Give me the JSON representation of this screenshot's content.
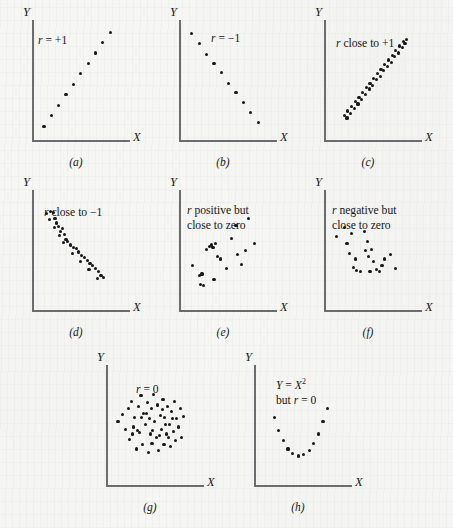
{
  "figure": {
    "axis_label_x": "X",
    "axis_label_y": "Y",
    "dot_color": "#17171c",
    "axis_color": "#6c6c70",
    "background_color": "#f6f6f4"
  },
  "panels": [
    {
      "id": "a",
      "caption": "(a)",
      "note_lines": [
        "r = +1"
      ],
      "note_html": "<i>r</i> = +1",
      "description": "perfect positive linear relationship"
    },
    {
      "id": "b",
      "caption": "(b)",
      "note_lines": [
        "r = −1"
      ],
      "note_html": "<i>r</i> = −1",
      "description": "perfect negative linear relationship"
    },
    {
      "id": "c",
      "caption": "(c)",
      "note_lines": [
        "r close to +1"
      ],
      "note_html": "<i>r</i> close to +1",
      "description": "strong positive linear relationship"
    },
    {
      "id": "d",
      "caption": "(d)",
      "note_lines": [
        "r close to −1"
      ],
      "note_html": "<i>r</i> close to −1",
      "description": "strong negative linear relationship"
    },
    {
      "id": "e",
      "caption": "(e)",
      "note_lines": [
        "r positive but",
        "close to zero"
      ],
      "note_html": "<i>r</i> positive but<br>close to zero",
      "description": "weak positive linear relationship"
    },
    {
      "id": "f",
      "caption": "(f)",
      "note_lines": [
        "r negative but",
        "close to zero"
      ],
      "note_html": "<i>r</i> negative but<br>close to zero",
      "description": "weak negative linear relationship"
    },
    {
      "id": "g",
      "caption": "(g)",
      "note_lines": [
        "r = 0"
      ],
      "note_html": "<i>r</i> = 0",
      "description": "no linear relationship, random cloud"
    },
    {
      "id": "h",
      "caption": "(h)",
      "note_lines": [
        "Y = X2",
        "but r = 0"
      ],
      "note_html": "<i>Y</i> = <i>X</i><sup>2</sup><br>but <i>r</i> = 0",
      "description": "exact quadratic relationship with zero linear correlation"
    }
  ],
  "chart_data": {
    "type": "scatter",
    "xlabel": "X",
    "ylabel": "Y",
    "xlim": [
      0,
      100
    ],
    "ylim": [
      0,
      100
    ],
    "grid": false,
    "legend": "none",
    "panel_layout": [
      [
        "a",
        "b",
        "c"
      ],
      [
        "d",
        "e",
        "f"
      ],
      [
        "g",
        "h"
      ]
    ],
    "panels": [
      {
        "id": "a",
        "annotation": "r = +1",
        "r": 1.0,
        "points": [
          [
            13,
            12
          ],
          [
            21,
            21
          ],
          [
            29,
            30
          ],
          [
            37,
            39
          ],
          [
            45,
            48
          ],
          [
            53,
            57
          ],
          [
            61,
            66
          ],
          [
            69,
            75
          ],
          [
            77,
            84
          ],
          [
            85,
            93
          ]
        ]
      },
      {
        "id": "b",
        "annotation": "r = -1",
        "r": -1.0,
        "points": [
          [
            14,
            92
          ],
          [
            22,
            83
          ],
          [
            30,
            74
          ],
          [
            38,
            66
          ],
          [
            46,
            58
          ],
          [
            54,
            49
          ],
          [
            62,
            41
          ],
          [
            70,
            32
          ],
          [
            78,
            24
          ],
          [
            86,
            15
          ]
        ]
      },
      {
        "id": "c",
        "annotation": "r close to +1",
        "r": 0.97,
        "points": [
          [
            22,
            21
          ],
          [
            25,
            19
          ],
          [
            26,
            25
          ],
          [
            29,
            23
          ],
          [
            30,
            29
          ],
          [
            33,
            27
          ],
          [
            34,
            33
          ],
          [
            37,
            31
          ],
          [
            38,
            37
          ],
          [
            41,
            35
          ],
          [
            42,
            41
          ],
          [
            45,
            39
          ],
          [
            46,
            45
          ],
          [
            49,
            44
          ],
          [
            50,
            49
          ],
          [
            53,
            47
          ],
          [
            54,
            53
          ],
          [
            57,
            52
          ],
          [
            58,
            57
          ],
          [
            61,
            55
          ],
          [
            62,
            61
          ],
          [
            65,
            60
          ],
          [
            66,
            65
          ],
          [
            69,
            63
          ],
          [
            70,
            69
          ],
          [
            73,
            67
          ],
          [
            74,
            73
          ],
          [
            77,
            72
          ],
          [
            78,
            77
          ],
          [
            81,
            75
          ],
          [
            82,
            81
          ],
          [
            85,
            80
          ],
          [
            86,
            85
          ],
          [
            88,
            83
          ],
          [
            90,
            87
          ]
        ]
      },
      {
        "id": "d",
        "annotation": "r close to -1",
        "r": -0.95,
        "points": [
          [
            16,
            83
          ],
          [
            20,
            85
          ],
          [
            23,
            84
          ],
          [
            19,
            78
          ],
          [
            25,
            79
          ],
          [
            27,
            75
          ],
          [
            24,
            71
          ],
          [
            29,
            72
          ],
          [
            31,
            68
          ],
          [
            33,
            70
          ],
          [
            30,
            64
          ],
          [
            35,
            65
          ],
          [
            37,
            61
          ],
          [
            34,
            58
          ],
          [
            39,
            59
          ],
          [
            42,
            56
          ],
          [
            45,
            54
          ],
          [
            48,
            53
          ],
          [
            44,
            49
          ],
          [
            51,
            50
          ],
          [
            54,
            47
          ],
          [
            57,
            45
          ],
          [
            53,
            42
          ],
          [
            60,
            43
          ],
          [
            63,
            40
          ],
          [
            66,
            38
          ],
          [
            62,
            35
          ],
          [
            69,
            36
          ],
          [
            72,
            33
          ],
          [
            75,
            30
          ],
          [
            71,
            27
          ],
          [
            78,
            28
          ]
        ]
      },
      {
        "id": "e",
        "annotation": "r positive but close to zero",
        "r": 0.25,
        "points": [
          [
            15,
            38
          ],
          [
            22,
            30
          ],
          [
            25,
            31
          ],
          [
            23,
            22
          ],
          [
            27,
            21
          ],
          [
            30,
            52
          ],
          [
            33,
            55
          ],
          [
            35,
            56
          ],
          [
            37,
            54
          ],
          [
            40,
            57
          ],
          [
            42,
            46
          ],
          [
            45,
            44
          ],
          [
            52,
            36
          ],
          [
            57,
            62
          ],
          [
            62,
            73
          ],
          [
            64,
            48
          ],
          [
            68,
            39
          ],
          [
            72,
            51
          ],
          [
            76,
            79
          ],
          [
            82,
            57
          ],
          [
            38,
            26
          ]
        ]
      },
      {
        "id": "f",
        "annotation": "r negative but close to zero",
        "r": -0.28,
        "points": [
          [
            14,
            63
          ],
          [
            22,
            71
          ],
          [
            25,
            57
          ],
          [
            30,
            66
          ],
          [
            28,
            49
          ],
          [
            34,
            44
          ],
          [
            32,
            37
          ],
          [
            35,
            34
          ],
          [
            40,
            33
          ],
          [
            44,
            68
          ],
          [
            47,
            59
          ],
          [
            45,
            51
          ],
          [
            48,
            46
          ],
          [
            52,
            52
          ],
          [
            54,
            42
          ],
          [
            57,
            35
          ],
          [
            60,
            33
          ],
          [
            63,
            38
          ],
          [
            66,
            44
          ],
          [
            72,
            48
          ],
          [
            78,
            36
          ],
          [
            50,
            33
          ]
        ]
      },
      {
        "id": "g",
        "annotation": "r = 0",
        "r": 0.0,
        "points": [
          [
            13,
            55
          ],
          [
            18,
            61
          ],
          [
            21,
            48
          ],
          [
            24,
            66
          ],
          [
            26,
            39
          ],
          [
            28,
            72
          ],
          [
            31,
            58
          ],
          [
            33,
            31
          ],
          [
            35,
            68
          ],
          [
            36,
            45
          ],
          [
            38,
            77
          ],
          [
            40,
            35
          ],
          [
            41,
            62
          ],
          [
            43,
            52
          ],
          [
            45,
            71
          ],
          [
            46,
            28
          ],
          [
            48,
            44
          ],
          [
            49,
            66
          ],
          [
            50,
            36
          ],
          [
            52,
            78
          ],
          [
            53,
            55
          ],
          [
            55,
            41
          ],
          [
            56,
            69
          ],
          [
            57,
            30
          ],
          [
            59,
            60
          ],
          [
            60,
            48
          ],
          [
            62,
            74
          ],
          [
            63,
            35
          ],
          [
            64,
            58
          ],
          [
            66,
            44
          ],
          [
            67,
            68
          ],
          [
            69,
            52
          ],
          [
            70,
            33
          ],
          [
            71,
            63
          ],
          [
            73,
            46
          ],
          [
            74,
            72
          ],
          [
            76,
            38
          ],
          [
            77,
            57
          ],
          [
            79,
            50
          ],
          [
            81,
            66
          ],
          [
            82,
            41
          ],
          [
            84,
            59
          ],
          [
            30,
            50
          ],
          [
            39,
            58
          ],
          [
            44,
            62
          ],
          [
            58,
            43
          ],
          [
            68,
            41
          ],
          [
            51,
            47
          ],
          [
            61,
            65
          ],
          [
            47,
            57
          ],
          [
            34,
            47
          ],
          [
            72,
            57
          ],
          [
            29,
            44
          ],
          [
            65,
            52
          ]
        ]
      },
      {
        "id": "h",
        "annotation": "Y = X^2 but r = 0",
        "r": 0.0,
        "points": [
          [
            22,
            58
          ],
          [
            27,
            47
          ],
          [
            32,
            38
          ],
          [
            37,
            31
          ],
          [
            42,
            27
          ],
          [
            48,
            25
          ],
          [
            54,
            26
          ],
          [
            60,
            30
          ],
          [
            65,
            36
          ],
          [
            70,
            44
          ],
          [
            75,
            55
          ],
          [
            80,
            66
          ]
        ]
      }
    ]
  }
}
